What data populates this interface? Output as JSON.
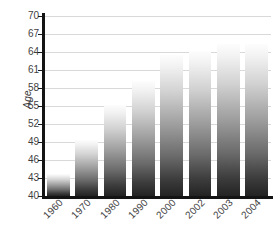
{
  "chart_data": {
    "type": "bar",
    "title": "",
    "subtitle": "",
    "xlabel": "",
    "ylabel": "Age",
    "categories": [
      "1960",
      "1970",
      "1980",
      "1990",
      "2000",
      "2002",
      "2003",
      "2004"
    ],
    "values": [
      43.7,
      49.3,
      55.2,
      59.2,
      63.5,
      64.2,
      65.3,
      65.3
    ],
    "ylim": [
      40,
      70
    ],
    "ytick_values": [
      40,
      43,
      46,
      49,
      52,
      55,
      58,
      61,
      64,
      67,
      70
    ],
    "ytick_labels": [
      "40",
      "43",
      "46",
      "49",
      "52",
      "55",
      "58",
      "61",
      "64",
      "67",
      "70"
    ],
    "ytick_step": 3,
    "grid": true,
    "grid_axis": "y",
    "legend": false,
    "legend_position": "none",
    "annotations": [],
    "xtick_rotation": -45,
    "ylabel_rotation": -90,
    "series": [
      {
        "name": "Age",
        "values": [
          43.7,
          49.3,
          55.2,
          59.2,
          63.5,
          64.2,
          65.3,
          65.3
        ]
      }
    ],
    "colors": {
      "bar_gradient_top": "#fdfdfd",
      "bar_gradient_bottom": "#232323",
      "gridline": "#d9d9d9",
      "axis": "#141414",
      "tick_text": "#3f3f3f",
      "background": "#ffffff"
    }
  }
}
